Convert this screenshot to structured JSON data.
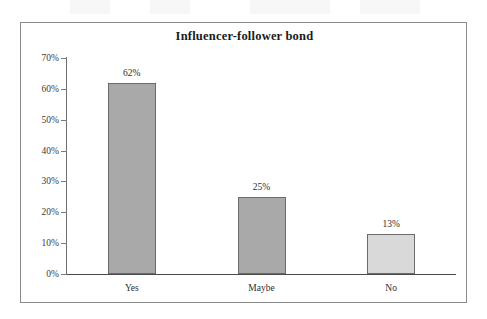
{
  "chart_data": {
    "type": "bar",
    "title": "Influencer-follower bond",
    "xlabel": "",
    "ylabel": "",
    "categories": [
      "Yes",
      "Maybe",
      "No"
    ],
    "values": [
      62,
      25,
      13
    ],
    "value_labels": [
      "62%",
      "25%",
      "13%"
    ],
    "ylim": [
      0,
      70
    ],
    "ytick_values": [
      0,
      10,
      20,
      30,
      40,
      50,
      60,
      70
    ],
    "ytick_labels": [
      "0%",
      "10%",
      "20%",
      "30%",
      "40%",
      "50%",
      "60%",
      "70%"
    ],
    "grid": false,
    "legend": false,
    "series": [
      {
        "name": "Influencer-follower bond",
        "values": [
          62,
          25,
          13
        ]
      }
    ],
    "bar_colors": [
      "#a9a9a9",
      "#a9a9a9",
      "#d9d9d9"
    ],
    "bar_border_color": "#6b6b6b",
    "axis_color": "#4a4a4a",
    "frame_color": "#8a8a8a",
    "text_color": "#2e2e2e",
    "title_color": "#1a1a1a",
    "background_color": "#ffffff"
  }
}
